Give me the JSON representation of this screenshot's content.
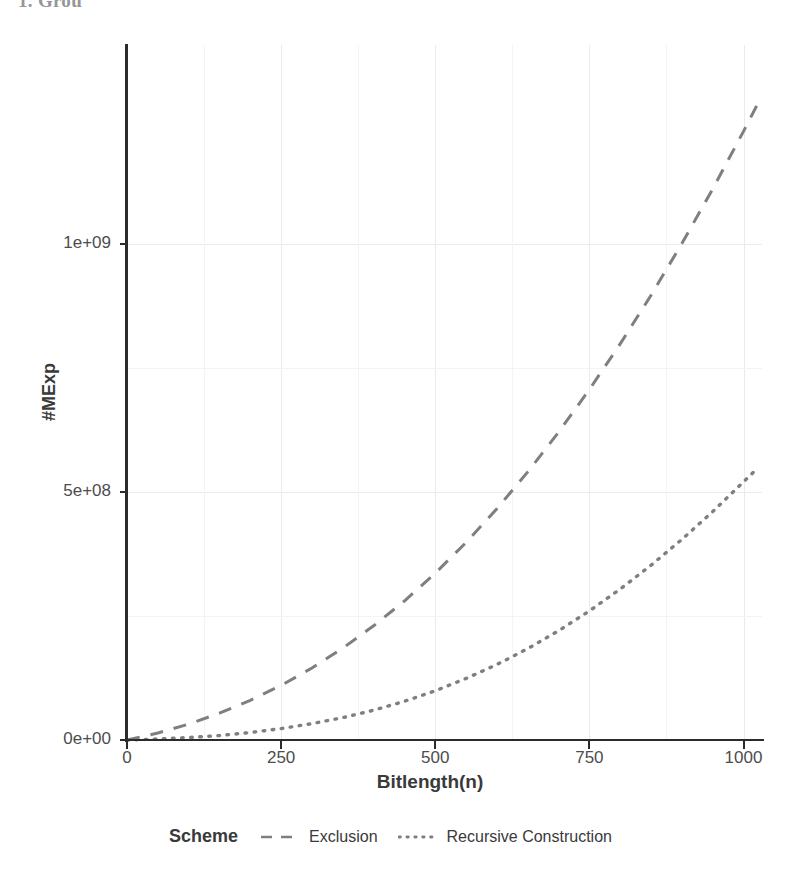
{
  "page": {
    "artifact_text": "1. Grou"
  },
  "chart_data": {
    "type": "line",
    "title": "",
    "xlabel": "Bitlength(n)",
    "ylabel": "#MExp",
    "xlim": [
      0,
      1030
    ],
    "ylim": [
      0,
      1400000000
    ],
    "grid": true,
    "legend_position": "bottom",
    "legend_title": "Scheme",
    "x_ticks": [
      0,
      250,
      500,
      750,
      1000
    ],
    "x_tick_labels": [
      "0",
      "250",
      "500",
      "750",
      "1000"
    ],
    "y_ticks": [
      0,
      500000000,
      1000000000
    ],
    "y_tick_labels": [
      "0e+00",
      "5e+08",
      "1e+09"
    ],
    "series": [
      {
        "name": "Exclusion",
        "linestyle": "dashed",
        "color": "#7f7f7f",
        "x": [
          0,
          50,
          100,
          150,
          200,
          250,
          300,
          350,
          400,
          450,
          500,
          550,
          600,
          650,
          700,
          750,
          800,
          850,
          900,
          950,
          1000,
          1024
        ],
        "y": [
          0,
          14000000,
          32000000,
          54000000,
          80000000,
          110000000,
          145000000,
          185000000,
          230000000,
          280000000,
          336000000,
          398000000,
          466000000,
          540000000,
          620000000,
          706000000,
          798000000,
          896000000,
          1000000000,
          1110000000,
          1226000000,
          1284000000
        ]
      },
      {
        "name": "Recursive Construction",
        "linestyle": "dotted",
        "color": "#7f7f7f",
        "x": [
          0,
          50,
          100,
          150,
          200,
          250,
          300,
          350,
          400,
          450,
          500,
          550,
          600,
          650,
          700,
          750,
          800,
          850,
          900,
          950,
          1000,
          1024
        ],
        "y": [
          0,
          2000000,
          5000000,
          9000000,
          15000000,
          23000000,
          33000000,
          45000000,
          60000000,
          78000000,
          99000000,
          124000000,
          152000000,
          184000000,
          220000000,
          260000000,
          304000000,
          352000000,
          404000000,
          460000000,
          520000000,
          549000000
        ]
      }
    ]
  },
  "legend": {
    "title": "Scheme",
    "entries": [
      {
        "label": "Exclusion",
        "style": "dashed"
      },
      {
        "label": "Recursive Construction",
        "style": "dotted"
      }
    ]
  },
  "colors": {
    "axis": "#2b2b2b",
    "grid_major": "#ebebeb",
    "grid_minor": "#f4f4f4",
    "series_line": "#7f7f7f",
    "text": "#4d4d4d",
    "panel_background": "#ffffff"
  }
}
